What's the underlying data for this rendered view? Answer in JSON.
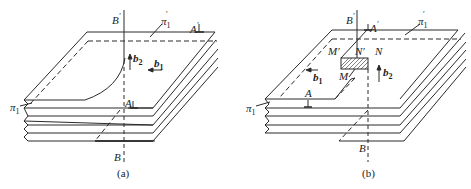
{
  "panels": [
    {
      "caption": "(a)",
      "labels": {
        "B_top": "B",
        "B_top_prime": "′",
        "B_bottom": "B",
        "pi_top": "π",
        "pi_top_sub": "1",
        "pi_top_prime": "′",
        "pi_left": "π",
        "pi_left_sub": "1",
        "A_top": "A",
        "A_top_prime": "′",
        "A_bottom": "A",
        "b2": "b",
        "b2_sub": "2",
        "b1": "b",
        "b1_sub": "1"
      }
    },
    {
      "caption": "(b)",
      "labels": {
        "B_top": "B",
        "B_top_prime": "′",
        "B_bottom": "B",
        "pi_top": "π",
        "pi_top_sub": "1",
        "pi_top_prime": "′",
        "pi_left": "π",
        "pi_left_sub": "1",
        "A_top": "A",
        "A_top_prime": "′",
        "A_bottom": "A",
        "M_prime": "M′",
        "N_prime": "N′",
        "N": "N",
        "M": "M",
        "b2": "b",
        "b2_sub": "2",
        "b1": "b",
        "b1_sub": "1"
      }
    }
  ],
  "colors": {
    "line": "#2a2a2a",
    "background": "#ffffff"
  }
}
